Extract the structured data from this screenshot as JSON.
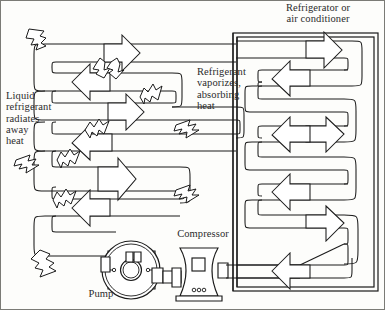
{
  "diagram": {
    "background_color": "#fdfdfb",
    "line_color": "#1a1a1a",
    "text_color": "#2b2b2b"
  },
  "labels": {
    "enclosure_title": "Refrigerator or\nair conditioner",
    "condenser_note": "Liquid\nrefrigerant\nradiates\naway\nheat",
    "evaporator_note": "Refrigerant\nvaporizes,\nabsorbing\nheat",
    "compressor": "Compressor",
    "pump": "Pump"
  },
  "components": [
    {
      "name": "condenser-coil",
      "kind": "serpentine-pipe",
      "location": "left-exterior",
      "description": "Outside serpentine coil where liquid refrigerant radiates heat away"
    },
    {
      "name": "evaporator-coil",
      "kind": "serpentine-pipe",
      "location": "right-interior",
      "description": "Coil inside the refrigerator or air conditioner where refrigerant vaporizes"
    },
    {
      "name": "pump",
      "kind": "rotary-machine",
      "description": "Circular pump housing with central hub driving refrigerant flow"
    },
    {
      "name": "compressor",
      "kind": "hourglass-vessel",
      "description": "Compressor body with access panel and base vents"
    },
    {
      "name": "enclosure",
      "kind": "double-line-box",
      "description": "Cabinet outline of the refrigerator or air conditioner"
    }
  ],
  "flow_arrows": {
    "coolant_direction": "clockwise",
    "outline_style": "hollow-block-arrow",
    "count_condenser": 6,
    "count_evaporator": 6
  },
  "heat_arrows": {
    "style": "jagged-wavy-outline-arrow",
    "meaning": "heat radiating away from condenser coil",
    "count": 9
  }
}
